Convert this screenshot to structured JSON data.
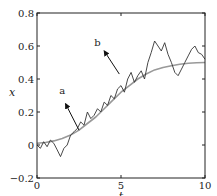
{
  "chart_data": {
    "type": "line",
    "title": "",
    "xlabel": "t",
    "ylabel": "x",
    "xlim": [
      0,
      10
    ],
    "ylim": [
      -0.2,
      0.8
    ],
    "xticks": [
      0,
      5,
      10
    ],
    "yticks": [
      -0.2,
      0,
      0.2,
      0.4,
      0.6,
      0.8
    ],
    "xtick_labels": [
      "0",
      "5",
      "10"
    ],
    "ytick_labels": [
      "−0.2",
      "0",
      "0.2",
      "0.4",
      "0.6",
      "0.8"
    ],
    "grid": false,
    "legend": null,
    "series": [
      {
        "name": "smooth",
        "color": "#999999",
        "x": [
          0,
          0.5,
          1,
          1.5,
          2,
          2.5,
          3,
          3.5,
          4,
          4.5,
          5,
          5.5,
          6,
          6.5,
          7,
          7.5,
          8,
          8.5,
          9,
          9.5,
          10
        ],
        "values": [
          0.01,
          0.015,
          0.025,
          0.04,
          0.06,
          0.09,
          0.13,
          0.17,
          0.22,
          0.27,
          0.32,
          0.36,
          0.4,
          0.43,
          0.455,
          0.47,
          0.48,
          0.49,
          0.495,
          0.498,
          0.5
        ]
      },
      {
        "name": "noisy",
        "color": "#333333",
        "x": [
          0,
          0.2,
          0.4,
          0.6,
          0.8,
          1.0,
          1.2,
          1.4,
          1.6,
          1.8,
          2.0,
          2.2,
          2.4,
          2.6,
          2.8,
          3.0,
          3.2,
          3.4,
          3.6,
          3.8,
          4.0,
          4.2,
          4.4,
          4.6,
          4.8,
          5.0,
          5.2,
          5.4,
          5.6,
          5.8,
          6.0,
          6.2,
          6.4,
          6.6,
          6.8,
          7.0,
          7.2,
          7.4,
          7.6,
          7.8,
          8.0,
          8.2,
          8.4,
          8.6,
          8.8,
          9.0,
          9.2,
          9.4,
          9.6,
          9.8,
          10.0
        ],
        "values": [
          0.0,
          -0.02,
          0.02,
          -0.01,
          0.03,
          0.01,
          -0.03,
          -0.07,
          -0.02,
          0.0,
          0.06,
          0.08,
          0.1,
          0.14,
          0.12,
          0.2,
          0.16,
          0.18,
          0.22,
          0.2,
          0.26,
          0.24,
          0.3,
          0.28,
          0.34,
          0.36,
          0.32,
          0.4,
          0.44,
          0.38,
          0.42,
          0.45,
          0.4,
          0.5,
          0.56,
          0.63,
          0.6,
          0.57,
          0.62,
          0.55,
          0.5,
          0.44,
          0.42,
          0.46,
          0.5,
          0.54,
          0.58,
          0.6,
          0.56,
          0.55,
          0.52
        ]
      }
    ],
    "annotations": [
      {
        "text": "a",
        "arrow_from": [
          2.5,
          0.09
        ],
        "arrow_to": [
          1.7,
          0.25
        ],
        "label_at": [
          1.5,
          0.31
        ]
      },
      {
        "text": "b",
        "arrow_from": [
          4.9,
          0.43
        ],
        "arrow_to": [
          4.0,
          0.57
        ],
        "label_at": [
          3.6,
          0.6
        ]
      }
    ]
  }
}
